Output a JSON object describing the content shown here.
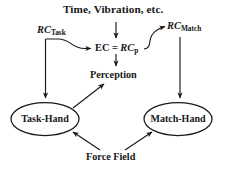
{
  "diagram": {
    "type": "flow-diagram",
    "background_color": "#ffffff",
    "stroke_color": "#1a1a1a",
    "title": "Time, Vibration, etc.",
    "nodes": {
      "title_input": "Time, Vibration, etc.",
      "rc_task": {
        "base": "RC",
        "sub": "Task",
        "full": "RC_Task"
      },
      "rc_match": {
        "base": "RC",
        "sub": "Match",
        "full": "RC_Match"
      },
      "ec_equation": {
        "lhs": "EC",
        "eq": "=",
        "rhs_base": "RC",
        "rhs_sub": "p",
        "full": "EC = RC_p"
      },
      "perception": "Perception",
      "task_hand": "Task-Hand",
      "match_hand": "Match-Hand",
      "force_field": "Force Field"
    },
    "edges": [
      {
        "from": "Time, Vibration, etc.",
        "to": "EC = RC_p",
        "style": "straight-arrow-down"
      },
      {
        "from": "RC_Task",
        "to": "EC = RC_p",
        "style": "curved-arrow-right"
      },
      {
        "from": "RC_Task",
        "to": "Task-Hand",
        "style": "straight-arrow-down"
      },
      {
        "from": "EC = RC_p",
        "to": "Perception",
        "style": "straight-arrow-down"
      },
      {
        "from": "EC = RC_p",
        "to": "RC_Match",
        "style": "curved-arrow-up-right"
      },
      {
        "from": "RC_Match",
        "to": "Match-Hand",
        "style": "straight-arrow-down"
      },
      {
        "from": "Task-Hand",
        "to": "Perception",
        "style": "straight-arrow-up-right"
      },
      {
        "from": "Force Field",
        "to": "Task-Hand",
        "style": "straight-arrow-up-left"
      },
      {
        "from": "Force Field",
        "to": "Match-Hand",
        "style": "straight-arrow-up-right"
      }
    ]
  }
}
